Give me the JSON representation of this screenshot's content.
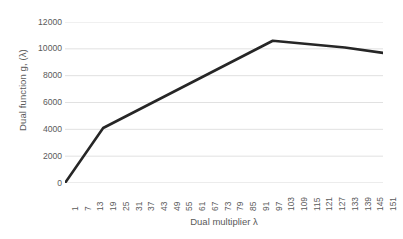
{
  "chart_data": {
    "type": "line",
    "title": "",
    "xlabel": "Dual multiplier λ",
    "ylabel": "Dual function g, (λ)",
    "xlim": [
      1,
      151
    ],
    "ylim": [
      0,
      12000
    ],
    "grid": true,
    "grid_axis": "y",
    "legend": "none",
    "line_color": "#262626",
    "axis_color": "#d9d9d9",
    "text_color": "#5a5a5a",
    "x_tick_labels": [
      "1",
      "7",
      "13",
      "19",
      "25",
      "31",
      "37",
      "43",
      "49",
      "55",
      "61",
      "67",
      "73",
      "79",
      "85",
      "91",
      "97",
      "103",
      "109",
      "115",
      "121",
      "127",
      "133",
      "139",
      "145",
      "151"
    ],
    "y_tick_labels": [
      "0",
      "2000",
      "4000",
      "6000",
      "8000",
      "10000",
      "12000"
    ],
    "y_tick_values": [
      0,
      2000,
      4000,
      6000,
      8000,
      10000,
      12000
    ],
    "series": [
      {
        "name": "Dual function",
        "x": [
          1,
          19,
          99,
          133,
          151
        ],
        "values": [
          0,
          4100,
          10600,
          10100,
          9700
        ]
      }
    ]
  }
}
